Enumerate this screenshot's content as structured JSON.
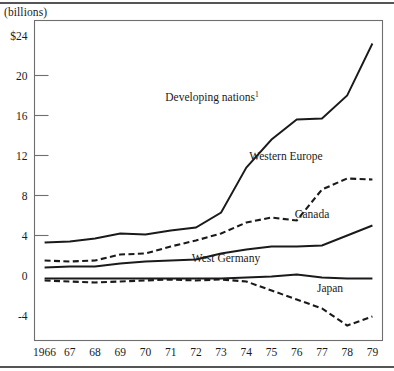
{
  "figure": {
    "unit_note": "(billions)",
    "background": "#ffffff",
    "line_color": "#1a1a1a",
    "frame_color": "#6e6e6e"
  },
  "chart_data": {
    "type": "line",
    "title": "",
    "subtitle": "",
    "xlabel": "",
    "ylabel": "(billions)",
    "grid": false,
    "legend_position": "inline-annotations",
    "x": [
      1966,
      1967,
      1968,
      1969,
      1970,
      1971,
      1972,
      1973,
      1974,
      1975,
      1976,
      1977,
      1978,
      1979
    ],
    "xtick_labels": [
      "1966",
      "67",
      "68",
      "69",
      "70",
      "71",
      "72",
      "73",
      "74",
      "75",
      "76",
      "77",
      "78",
      "79"
    ],
    "ytick_labels": [
      "$24",
      "20",
      "16",
      "12",
      "8",
      "4",
      "0",
      "-4"
    ],
    "ytick_values": [
      24,
      20,
      16,
      12,
      8,
      4,
      0,
      -4
    ],
    "ylim": [
      -6.5,
      25.5
    ],
    "xlim": [
      1965.6,
      1979.4
    ],
    "series": [
      {
        "name": "Developing nations",
        "label": "Developing nations",
        "label_superscript": "1",
        "style": "solid",
        "values": [
          3.3,
          3.4,
          3.7,
          4.2,
          4.1,
          4.5,
          4.8,
          6.3,
          10.8,
          13.6,
          15.6,
          15.7,
          18.0,
          23.2
        ]
      },
      {
        "name": "Western Europe",
        "label": "Western Europe",
        "label_superscript": "",
        "style": "dashed",
        "values": [
          1.5,
          1.4,
          1.5,
          2.1,
          2.2,
          2.9,
          3.5,
          4.2,
          5.3,
          5.8,
          5.5,
          8.6,
          9.7,
          9.6
        ]
      },
      {
        "name": "Canada",
        "label": "Canada",
        "label_superscript": "",
        "style": "solid",
        "values": [
          0.8,
          0.9,
          0.9,
          1.2,
          1.4,
          1.5,
          1.6,
          2.2,
          2.6,
          2.9,
          2.9,
          3.0,
          4.0,
          5.0
        ]
      },
      {
        "name": "West Germany",
        "label": "West Germany",
        "label_superscript": "",
        "style": "solid",
        "values": [
          -0.3,
          -0.3,
          -0.3,
          -0.3,
          -0.3,
          -0.3,
          -0.3,
          -0.3,
          -0.2,
          -0.1,
          0.1,
          -0.2,
          -0.3,
          -0.3
        ]
      },
      {
        "name": "Japan",
        "label": "Japan",
        "label_superscript": "",
        "style": "dashed",
        "values": [
          -0.5,
          -0.6,
          -0.7,
          -0.6,
          -0.5,
          -0.4,
          -0.5,
          -0.4,
          -0.6,
          -1.5,
          -2.4,
          -3.3,
          -5.0,
          -4.1
        ]
      }
    ],
    "annotations": [
      {
        "text": "Developing nations",
        "superscript": "1",
        "x_px": 212,
        "y_px": 101
      },
      {
        "text": "Western Europe",
        "superscript": "",
        "x_px": 286,
        "y_px": 160
      },
      {
        "text": "Canada",
        "superscript": "",
        "x_px": 312,
        "y_px": 218
      },
      {
        "text": "West Germany",
        "superscript": "",
        "x_px": 226,
        "y_px": 262
      },
      {
        "text": "Japan",
        "superscript": "",
        "x_px": 330,
        "y_px": 292
      }
    ]
  }
}
